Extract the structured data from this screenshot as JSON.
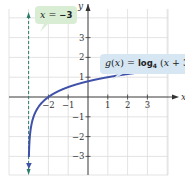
{
  "chart_data": {
    "type": "line",
    "title": "",
    "xlabel": "x",
    "ylabel": "y",
    "xlim": [
      -4,
      4
    ],
    "ylim": [
      -4,
      4
    ],
    "grid": true,
    "x_ticks": [
      -2,
      -1,
      1,
      2,
      3
    ],
    "x_tick_labels": [
      "−2",
      "−1",
      "1",
      "2",
      "3"
    ],
    "y_ticks": [
      3,
      2,
      1,
      -1,
      -2,
      -3
    ],
    "y_tick_labels": [
      "3",
      "2",
      "1",
      "−1",
      "−2",
      "−3"
    ],
    "series": [
      {
        "name": "g(x) = log4 (x + 3)",
        "function": "log4(x+3)",
        "color": "#3f51a8",
        "x": [
          -2.98,
          -2.95,
          -2.9,
          -2.8,
          -2.5,
          -2,
          -1,
          0,
          1,
          2,
          3.7
        ],
        "y": [
          -2.82,
          -2.16,
          -1.66,
          -1.16,
          -0.5,
          0,
          0.5,
          0.79,
          1.0,
          1.16,
          1.37
        ]
      },
      {
        "name": "x = −3",
        "type": "vertical-asymptote",
        "x_value": -3,
        "style": "dashed",
        "color": "#2e7d6b"
      }
    ],
    "annotations": [
      {
        "text": "x = −3",
        "target": "vertical asymptote"
      },
      {
        "text": "g(x) = log4 (x + 3)",
        "target": "curve"
      }
    ]
  },
  "labels": {
    "asymptote": {
      "lhs": "x",
      "eq": " = ",
      "rhs": "−3"
    },
    "function": {
      "name": "g",
      "arg_open": "(",
      "arg": "x",
      "arg_close": ")",
      "eq": " = ",
      "log": "log",
      "base": "4",
      "expr_open": " (",
      "expr_var": "x",
      "expr_rest": " + 3)"
    },
    "x_axis_label": "x",
    "y_axis_label": "y"
  },
  "colors": {
    "curve": "#3f51a8",
    "asymptote": "#2e7d6b",
    "grid": "#dcdcdc",
    "axis": "#333333",
    "callout_asym_bg": "#d9edd4",
    "callout_func_bg": "#d6e6f2"
  }
}
